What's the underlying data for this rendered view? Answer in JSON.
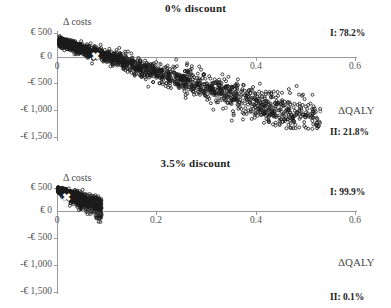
{
  "figure": {
    "type": "cost-effectiveness-plane",
    "panel_count": 2
  },
  "panels": {
    "top": {
      "title": "0% discount",
      "y_axis_title": "Δ costs",
      "x_axis_title": "ΔQALY",
      "quadrant_I_label": "I: 78.2%",
      "quadrant_II_label": "II: 21.8%",
      "origin_label": "0",
      "y_ticks": [
        "€ 500",
        "€ 0",
        "-€ 500",
        "-€ 1,000",
        "-€ 1,500"
      ],
      "x_ticks": [
        "0",
        "0.2",
        "0.4",
        "0.6"
      ]
    },
    "bottom": {
      "title": "3.5% discount",
      "y_axis_title": "Δ costs",
      "x_axis_title": "ΔQALY",
      "quadrant_I_label": "I: 99.9%",
      "quadrant_II_label": "II: 0.1%",
      "origin_label": "0",
      "y_ticks": [
        "€ 500",
        "€ 0",
        "-€ 500",
        "-€ 1,000",
        "-€ 1,500"
      ],
      "x_ticks": [
        "0",
        "0.2",
        "0.4",
        "0.6"
      ]
    }
  },
  "chart_data": [
    {
      "type": "scatter",
      "title": "0% discount",
      "xlabel": "ΔQALY",
      "ylabel": "Δ costs",
      "xlim": [
        0,
        0.6
      ],
      "ylim": [
        -1500,
        500
      ],
      "grid": false,
      "legend": null,
      "annotations": [
        "I: 78.2%",
        "II: 21.8%"
      ],
      "quadrant_percentages": {
        "I": 78.2,
        "II": 21.8
      },
      "mean_point": {
        "x": 0.077,
        "y": 25,
        "marker": "x",
        "color": "#ffffff"
      },
      "cloud": {
        "description": "dense elongated downward-sloping cloud from near origin, thinning into sparse outliers to the right",
        "n_points": 2000,
        "x_range": [
          0.005,
          0.53
        ],
        "y_range": [
          -1300,
          400
        ],
        "slope": -3200,
        "intercept": 330,
        "spread_y": 120,
        "marker": "open-circle",
        "color": "#1a1a1a"
      },
      "outliers": [
        {
          "x": 0.29,
          "y": -560
        },
        {
          "x": 0.3,
          "y": -640
        },
        {
          "x": 0.31,
          "y": -760
        },
        {
          "x": 0.33,
          "y": -900
        },
        {
          "x": 0.34,
          "y": -1060
        },
        {
          "x": 0.36,
          "y": -780
        },
        {
          "x": 0.4,
          "y": -1130
        },
        {
          "x": 0.43,
          "y": -1000
        },
        {
          "x": 0.43,
          "y": -1100
        },
        {
          "x": 0.47,
          "y": -980
        },
        {
          "x": 0.48,
          "y": -1180
        },
        {
          "x": 0.49,
          "y": -1250
        },
        {
          "x": 0.53,
          "y": -1130
        }
      ]
    },
    {
      "type": "scatter",
      "title": "3.5% discount",
      "xlabel": "ΔQALY",
      "ylabel": "Δ costs",
      "xlim": [
        0,
        0.6
      ],
      "ylim": [
        -1500,
        500
      ],
      "grid": false,
      "legend": null,
      "annotations": [
        "I: 99.9%",
        "II: 0.1%"
      ],
      "quadrant_percentages": {
        "I": 99.9,
        "II": 0.1
      },
      "mean_point": {
        "x": 0.018,
        "y": 300,
        "marker": "x",
        "color": "#ffffff"
      },
      "cloud": {
        "description": "small tight downward-sloping cluster hugging the origin, a few points crossing below zero",
        "n_points": 1200,
        "x_range": [
          0.002,
          0.09
        ],
        "y_range": [
          -60,
          480
        ],
        "slope": -4600,
        "intercept": 450,
        "spread_y": 70,
        "marker": "open-circle",
        "color": "#1a1a1a"
      },
      "outliers": [
        {
          "x": 0.055,
          "y": 40
        },
        {
          "x": 0.06,
          "y": 10
        },
        {
          "x": 0.064,
          "y": -10
        },
        {
          "x": 0.068,
          "y": 30
        },
        {
          "x": 0.072,
          "y": -30
        },
        {
          "x": 0.078,
          "y": -40
        },
        {
          "x": 0.086,
          "y": -55
        }
      ]
    }
  ]
}
